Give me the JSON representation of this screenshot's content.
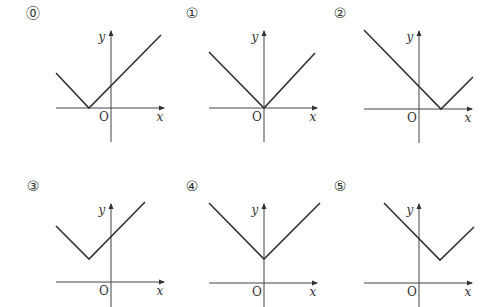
{
  "options": [
    {
      "label": "⓪",
      "origin_label": "O",
      "x_label": "x",
      "y_label": "y",
      "axes": {
        "ox": 111,
        "oy": 108,
        "x_left": 56,
        "x_right": 164,
        "y_top": 31,
        "y_bottom": 142
      },
      "curve": {
        "left": [
          56,
          73
        ],
        "vertex": [
          89,
          108
        ],
        "right": [
          161,
          35
        ]
      },
      "label_pos": [
        33,
        18
      ],
      "description": "V-shaped graph with vertex on negative x-axis"
    },
    {
      "label": "①",
      "origin_label": "O",
      "x_label": "x",
      "y_label": "y",
      "axes": {
        "ox": 264,
        "oy": 108,
        "x_left": 209,
        "x_right": 317,
        "y_top": 31,
        "y_bottom": 142
      },
      "curve": {
        "left": [
          209,
          52
        ],
        "vertex": [
          264,
          108
        ],
        "right": [
          315,
          53
        ]
      },
      "label_pos": [
        192,
        18
      ],
      "description": "V-shaped graph with vertex at origin"
    },
    {
      "label": "②",
      "origin_label": "O",
      "x_label": "x",
      "y_label": "y",
      "axes": {
        "ox": 419,
        "oy": 109,
        "x_left": 364,
        "x_right": 472,
        "y_top": 31,
        "y_bottom": 143
      },
      "curve": {
        "left": [
          364,
          30
        ],
        "vertex": [
          441,
          109
        ],
        "right": [
          473,
          77
        ]
      },
      "label_pos": [
        340,
        18
      ],
      "description": "V-shaped graph with vertex on positive x-axis"
    },
    {
      "label": "③",
      "origin_label": "O",
      "x_label": "x",
      "y_label": "y",
      "axes": {
        "ox": 111,
        "oy": 282,
        "x_left": 56,
        "x_right": 164,
        "y_top": 204,
        "y_bottom": 307
      },
      "curve": {
        "left": [
          56,
          226
        ],
        "vertex": [
          89,
          259
        ],
        "right": [
          145,
          202
        ]
      },
      "label_pos": [
        33,
        191
      ],
      "description": "V-shaped graph with vertex in second quadrant"
    },
    {
      "label": "④",
      "origin_label": "O",
      "x_label": "x",
      "y_label": "y",
      "axes": {
        "ox": 264,
        "oy": 283,
        "x_left": 209,
        "x_right": 317,
        "y_top": 204,
        "y_bottom": 307
      },
      "curve": {
        "left": [
          209,
          203
        ],
        "vertex": [
          264,
          259
        ],
        "right": [
          320,
          203
        ]
      },
      "label_pos": [
        192,
        191
      ],
      "description": "V-shaped graph with vertex on positive y-axis"
    },
    {
      "label": "⑤",
      "origin_label": "O",
      "x_label": "x",
      "y_label": "y",
      "axes": {
        "ox": 419,
        "oy": 283,
        "x_left": 364,
        "x_right": 472,
        "y_top": 204,
        "y_bottom": 307
      },
      "curve": {
        "left": [
          384,
          203
        ],
        "vertex": [
          440,
          260
        ],
        "right": [
          474,
          227
        ]
      },
      "label_pos": [
        340,
        191
      ],
      "description": "V-shaped graph with vertex in first quadrant"
    }
  ]
}
